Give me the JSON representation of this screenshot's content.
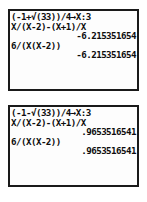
{
  "device": {
    "type": "graphing-calculator-home-screen",
    "screen_count": 2,
    "text_color": "#0d0d0d",
    "lcd_background": "#fdfdfd",
    "border_color": "#1a1a1a"
  },
  "screens": [
    {
      "name": "top-calculator-screen",
      "lines": [
        {
          "text": "(-1+√(33))/4→X:3",
          "align": "left"
        },
        {
          "text": "X/(X-2)-(X+1)/X",
          "align": "left"
        },
        {
          "text": "-6.215351654",
          "align": "right"
        },
        {
          "text": "6/(X(X-2))",
          "align": "left"
        },
        {
          "text": "-6.215351654",
          "align": "right"
        },
        {
          "text": "",
          "align": "left"
        },
        {
          "text": "",
          "align": "left"
        },
        {
          "text": "",
          "align": "left"
        }
      ]
    },
    {
      "name": "bottom-calculator-screen",
      "lines": [
        {
          "text": "(-1-√(33))/4→X:3",
          "align": "left"
        },
        {
          "text": "X/(X-2)-(X+1)/X",
          "align": "left"
        },
        {
          "text": ".9653516541",
          "align": "right"
        },
        {
          "text": "6/(X(X-2))",
          "align": "left"
        },
        {
          "text": ".9653516541",
          "align": "right"
        },
        {
          "text": "",
          "align": "left"
        },
        {
          "text": "",
          "align": "left"
        },
        {
          "text": "",
          "align": "left"
        }
      ]
    }
  ]
}
